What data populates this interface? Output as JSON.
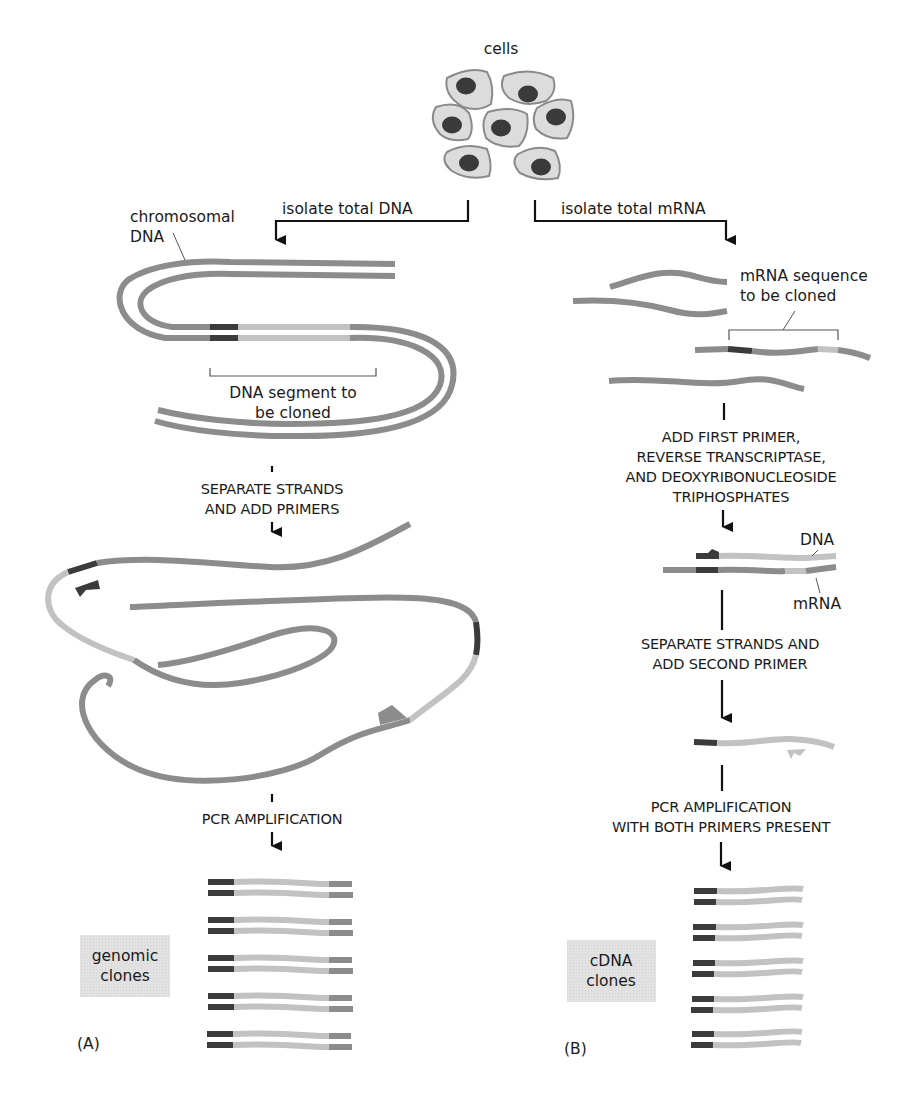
{
  "title_label": "cells",
  "colors": {
    "strand_medium": "#8c8c8c",
    "strand_dark": "#3b3b3b",
    "strand_light": "#c2c2c2",
    "cell_fill": "#dcdcdc",
    "cell_outline": "#8a8a8a",
    "nucleus": "#3a3a3a",
    "clone_box": "#e4e4e4"
  },
  "panel_a": {
    "branch_label": "isolate total DNA",
    "chromosome_label_line1": "chromosomal",
    "chromosome_label_line2": "DNA",
    "segment_label_line1": "DNA segment to",
    "segment_label_line2": "be cloned",
    "step1_line1": "SEPARATE STRANDS",
    "step1_line2": "AND ADD PRIMERS",
    "step2": "PCR AMPLIFICATION",
    "clones_line1": "genomic",
    "clones_line2": "clones",
    "panel_letter": "(A)"
  },
  "panel_b": {
    "branch_label": "isolate total mRNA",
    "sequence_label_line1": "mRNA sequence",
    "sequence_label_line2": "to be cloned",
    "step1_line1": "ADD FIRST PRIMER,",
    "step1_line2": "REVERSE TRANSCRIPTASE,",
    "step1_line3": "AND DEOXYRIBONUCLEOSIDE",
    "step1_line4": "TRIPHOSPHATES",
    "dna_label": "DNA",
    "mrna_label": "mRNA",
    "step2_line1": "SEPARATE STRANDS AND",
    "step2_line2": "ADD SECOND PRIMER",
    "step3_line1": "PCR AMPLIFICATION",
    "step3_line2": "WITH BOTH PRIMERS PRESENT",
    "clones_line1": "cDNA",
    "clones_line2": "clones",
    "panel_letter": "(B)"
  }
}
